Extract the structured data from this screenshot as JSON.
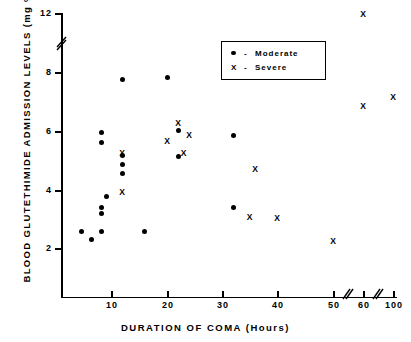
{
  "chart_data": {
    "type": "scatter",
    "title": "",
    "xlabel": "DURATION  OF  COMA   (Hours)",
    "ylabel": "BLOOD  GLUTETHIMIDE  ADMISSION  LEVELS  (mg %)",
    "xlim": [
      0,
      100
    ],
    "ylim": [
      0,
      12
    ],
    "grid": false,
    "axis_breaks": {
      "y_break_between": [
        8,
        12
      ],
      "x_break_between": [
        [
          50,
          60
        ],
        [
          60,
          100
        ]
      ]
    },
    "xticks": [
      {
        "label": "10",
        "value": 10
      },
      {
        "label": "20",
        "value": 20
      },
      {
        "label": "30",
        "value": 30
      },
      {
        "label": "40",
        "value": 40
      },
      {
        "label": "50",
        "value": 50
      },
      {
        "label": "60",
        "value": 60
      },
      {
        "label": "100",
        "value": 100
      }
    ],
    "yticks": [
      {
        "label": "12",
        "value": 12
      },
      {
        "label": "8",
        "value": 8
      },
      {
        "label": "6",
        "value": 6
      },
      {
        "label": "4",
        "value": 4
      },
      {
        "label": "2",
        "value": 2
      }
    ],
    "legend": {
      "position": "top-right-inside",
      "entries": [
        {
          "marker": "dot",
          "dash": "-",
          "label": "Moderate"
        },
        {
          "marker": "x",
          "dash": "-",
          "label": "Severe"
        }
      ]
    },
    "series": [
      {
        "name": "Moderate",
        "marker": "dot",
        "color": "#000000",
        "points": [
          {
            "x": 4,
            "y": 2.6
          },
          {
            "x": 6,
            "y": 2.3
          },
          {
            "x": 8,
            "y": 2.6
          },
          {
            "x": 8,
            "y": 5.95
          },
          {
            "x": 8,
            "y": 5.62
          },
          {
            "x": 8,
            "y": 3.42
          },
          {
            "x": 8,
            "y": 3.22
          },
          {
            "x": 9,
            "y": 3.8
          },
          {
            "x": 12,
            "y": 7.75
          },
          {
            "x": 12,
            "y": 5.18
          },
          {
            "x": 12,
            "y": 4.88
          },
          {
            "x": 12,
            "y": 4.58
          },
          {
            "x": 16,
            "y": 2.6
          },
          {
            "x": 20,
            "y": 7.82
          },
          {
            "x": 22,
            "y": 6.02
          },
          {
            "x": 22,
            "y": 5.15
          },
          {
            "x": 32,
            "y": 5.85
          },
          {
            "x": 32,
            "y": 3.42
          }
        ]
      },
      {
        "name": "Severe",
        "marker": "x",
        "color": "#000000",
        "points": [
          {
            "x": 12,
            "y": 5.28
          },
          {
            "x": 12,
            "y": 3.95
          },
          {
            "x": 20,
            "y": 5.68
          },
          {
            "x": 22,
            "y": 6.3
          },
          {
            "x": 23,
            "y": 5.28
          },
          {
            "x": 24,
            "y": 5.88
          },
          {
            "x": 36,
            "y": 4.72
          },
          {
            "x": 35,
            "y": 3.07
          },
          {
            "x": 40,
            "y": 3.05
          },
          {
            "x": 50,
            "y": 2.25
          },
          {
            "x": 60,
            "y": 12.0
          },
          {
            "x": 60,
            "y": 6.85
          },
          {
            "x": 100,
            "y": 7.18
          }
        ]
      }
    ]
  }
}
